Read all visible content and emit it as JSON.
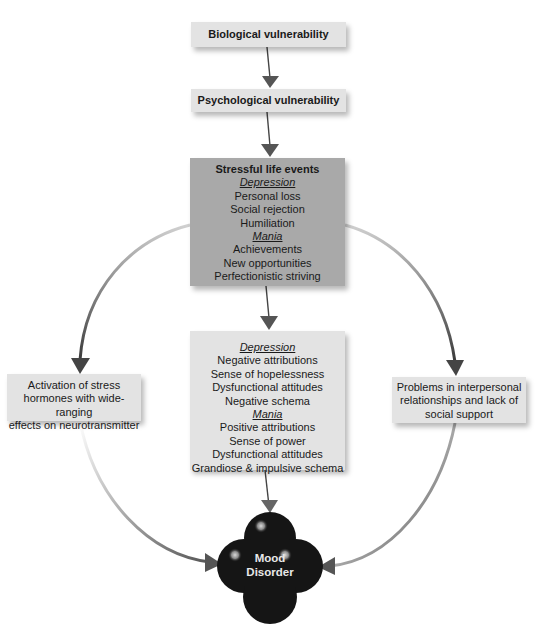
{
  "diagram": {
    "boxes": {
      "biological": {
        "label": "Biological vulnerability"
      },
      "psychological": {
        "label": "Psychological vulnerability"
      },
      "stressful": {
        "title": "Stressful life events",
        "sections": [
          {
            "heading": "Depression",
            "items": [
              "Personal loss",
              "Social rejection",
              "Humiliation"
            ]
          },
          {
            "heading": "Mania",
            "items": [
              "Achievements",
              "New opportunities",
              "Perfectionistic striving"
            ]
          }
        ]
      },
      "cognitive": {
        "sections": [
          {
            "heading": "Depression",
            "items": [
              "Negative attributions",
              "Sense of hopelessness",
              "Dysfunctional attitudes",
              "Negative schema"
            ]
          },
          {
            "heading": "Mania",
            "items": [
              "Positive attributions",
              "Sense of power",
              "Dysfunctional attitudes",
              "Grandiose & impulsive schema"
            ]
          }
        ]
      },
      "hormones": {
        "lines": [
          "Activation of stress",
          "hormones with wide-ranging",
          "effects on neurotransmitter"
        ]
      },
      "social": {
        "lines": [
          "Problems in interpersonal",
          "relationships and lack of",
          "social support"
        ]
      }
    },
    "outcome": {
      "lines": [
        "Mood",
        "Disorder"
      ]
    },
    "colors": {
      "light_box": "#e3e3e3",
      "dark_box": "#a9a9a9",
      "arrow": "#555555",
      "cloud": "#151515"
    }
  }
}
